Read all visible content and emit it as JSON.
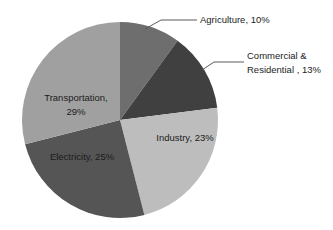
{
  "chart_data": {
    "type": "pie",
    "title": "",
    "subtitle": "",
    "xlabel": "",
    "ylabel": "",
    "legend_position": "none",
    "grid": false,
    "unit": "%",
    "categories": [
      "Agriculture",
      "Commercial & Residential",
      "Industry",
      "Electricity",
      "Transportation"
    ],
    "values": [
      10,
      13,
      23,
      25,
      29
    ],
    "colors": [
      "#6e6e6e",
      "#404040",
      "#bdbdbd",
      "#555555",
      "#a0a0a0"
    ],
    "slices": [
      {
        "name": "Agriculture",
        "value": 10,
        "label": "Agriculture, 10%",
        "color": "#6e6e6e",
        "label_placement": "outside",
        "start_angle_deg": 0,
        "end_angle_deg": 36
      },
      {
        "name": "Commercial & Residential",
        "value": 13,
        "label_line1": "Commercial &",
        "label_line2": "Residential , 13%",
        "color": "#404040",
        "label_placement": "outside",
        "start_angle_deg": 36,
        "end_angle_deg": 82.8
      },
      {
        "name": "Industry",
        "value": 23,
        "label": "Industry, 23%",
        "color": "#bdbdbd",
        "label_placement": "inside",
        "start_angle_deg": 82.8,
        "end_angle_deg": 165.6
      },
      {
        "name": "Electricity",
        "value": 25,
        "label": "Electricity, 25%",
        "color": "#555555",
        "label_placement": "inside",
        "start_angle_deg": 165.6,
        "end_angle_deg": 255.6
      },
      {
        "name": "Transportation",
        "value": 29,
        "label_line1": "Transportation,",
        "label_line2": "29%",
        "color": "#a0a0a0",
        "label_placement": "inside",
        "start_angle_deg": 255.6,
        "end_angle_deg": 360
      }
    ]
  }
}
